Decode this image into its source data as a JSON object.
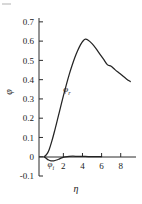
{
  "chart_data": {
    "type": "line",
    "title": "",
    "xlabel": "η",
    "ylabel": "φ",
    "xlim": [
      -0.55,
      9.6
    ],
    "ylim": [
      -0.1,
      0.72
    ],
    "grid": false,
    "legend": "inline-curve-labels",
    "x_ticks": [
      2,
      4,
      6,
      8
    ],
    "x_tick_labels": [
      "2",
      "4",
      "6",
      "8"
    ],
    "y_ticks": [
      -0.1,
      0,
      0.1,
      0.2,
      0.3,
      0.4,
      0.5,
      0.6,
      0.7
    ],
    "y_tick_labels": [
      "-0.1",
      "0",
      "0.1",
      "0.2",
      "0.3",
      "0.4",
      "0.5",
      "0.6",
      "0.7"
    ],
    "series": [
      {
        "name": "φr",
        "label_text": "φ",
        "label_sub": "r",
        "label_x": 2.0,
        "label_y": 0.335,
        "color": "#242424",
        "x": [
          0,
          0.25,
          0.5,
          0.8,
          1.1,
          1.4,
          1.7,
          2.0,
          2.3,
          2.6,
          2.9,
          3.2,
          3.5,
          3.8,
          4.1,
          4.3,
          4.6,
          5.0,
          5.4,
          5.8,
          6.2,
          6.6,
          7.0,
          7.4,
          7.8,
          8.2,
          8.6,
          9.0
        ],
        "y": [
          0.0,
          0.012,
          0.035,
          0.082,
          0.137,
          0.196,
          0.256,
          0.316,
          0.372,
          0.425,
          0.472,
          0.515,
          0.551,
          0.582,
          0.603,
          0.61,
          0.605,
          0.587,
          0.562,
          0.534,
          0.506,
          0.478,
          0.47,
          0.452,
          0.436,
          0.42,
          0.404,
          0.39
        ]
      },
      {
        "name": "φi",
        "label_text": "φ",
        "label_sub": "i",
        "label_x": 0.35,
        "label_y": -0.055,
        "color": "#242424",
        "x": [
          0,
          0.2,
          0.45,
          0.7,
          1.0,
          1.3,
          1.6,
          1.9,
          2.2,
          2.6,
          3.0,
          3.5,
          4.0,
          4.6,
          5.2,
          5.6,
          6.0
        ],
        "y": [
          0.0,
          -0.008,
          -0.017,
          -0.021,
          -0.021,
          -0.017,
          -0.011,
          -0.005,
          -0.001,
          0.002,
          0.003,
          0.002,
          0.002,
          0.001,
          0.001,
          0.0005,
          0.0
        ]
      }
    ],
    "peak": {
      "x": 4.3,
      "y": 0.61
    },
    "annotations": []
  }
}
